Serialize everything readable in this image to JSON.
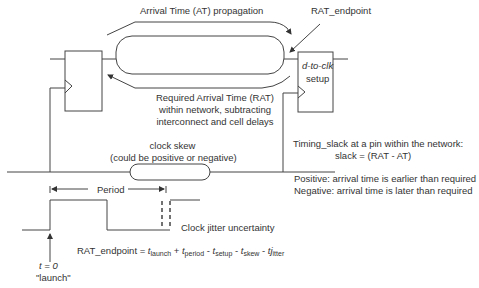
{
  "diagram": {
    "labels": {
      "at_propagation": "Arrival Time (AT) propagation",
      "rat_endpoint": "RAT_endpoint",
      "setup_block_line1": "d-to-clk",
      "setup_block_line2": "setup",
      "rat_line1": "Required Arrival Time (RAT)",
      "rat_line2": "within network, subtracting",
      "rat_line3": "interconnect and cell delays",
      "clock_skew_line1": "clock skew",
      "clock_skew_line2": "(could be positive or negative)",
      "slack_line1": "Timing_slack at a pin within the network:",
      "slack_line2": "slack = (RAT - AT)",
      "positive": "Positive:  arrival time is earlier than required",
      "negative": "Negative: arrival time is later than required",
      "period": "Period",
      "jitter": "Clock jitter uncertainty",
      "t0": "t = 0",
      "launch": "\"launch\""
    },
    "equation": {
      "lhs": "RAT_endpoint = ",
      "terms": [
        {
          "sign": "",
          "var": "t",
          "sub": "launch"
        },
        {
          "sign": " + ",
          "var": "t",
          "sub": "period"
        },
        {
          "sign": " - ",
          "var": "t",
          "sub": "setup"
        },
        {
          "sign": " - ",
          "var": "t",
          "sub": "skew"
        },
        {
          "sign": " - ",
          "var": "tj",
          "sub": "itter"
        }
      ]
    }
  }
}
